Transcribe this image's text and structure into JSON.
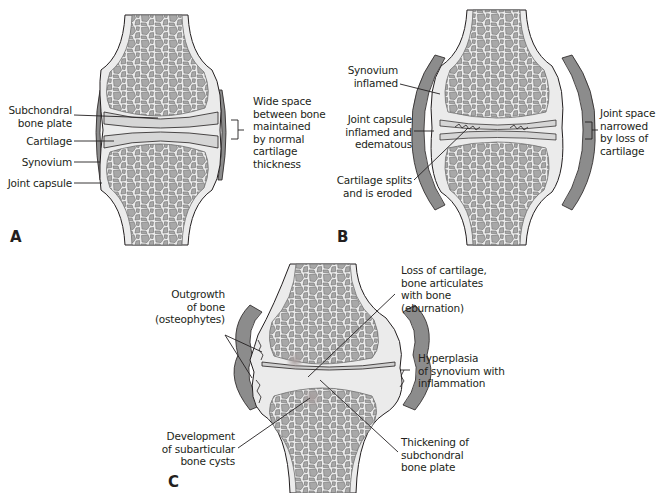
{
  "figure": {
    "colors": {
      "bone_fill": "#ebebeb",
      "trabecula": "#a8a8a8",
      "trabecula_outline": "#6e6e6e",
      "cartilage": "#d6d6d6",
      "capsule": "#8c8c8c",
      "line": "#231f20",
      "cyst": "#b0a8a8"
    }
  },
  "panels": {
    "a": {
      "letter": "A",
      "labels": {
        "subchondral": "Subchondral\nbone plate",
        "cartilage": "Cartilage",
        "synovium": "Synovium",
        "capsule": "Joint capsule",
        "space": "Wide space\nbetween bone\nmaintained\nby normal\ncartilage\nthickness"
      }
    },
    "b": {
      "letter": "B",
      "labels": {
        "synovium": "Synovium\ninflamed",
        "capsule": "Joint capsule\ninflamed and\nedematous",
        "splits": "Cartilage splits\nand is eroded",
        "space": "Joint space\nnarrowed\nby loss of\ncartilage"
      }
    },
    "c": {
      "letter": "C",
      "labels": {
        "osteophytes": "Outgrowth\nof bone\n(osteophytes)",
        "eburnation": "Loss of cartilage,\nbone articulates\nwith bone\n(eburnation)",
        "hyperplasia": "Hyperplasia\nof synovium with\ninflammation",
        "cysts": "Development\nof subarticular\nbone cysts",
        "thickening": "Thickening of\nsubchondral\nbone plate"
      }
    }
  }
}
